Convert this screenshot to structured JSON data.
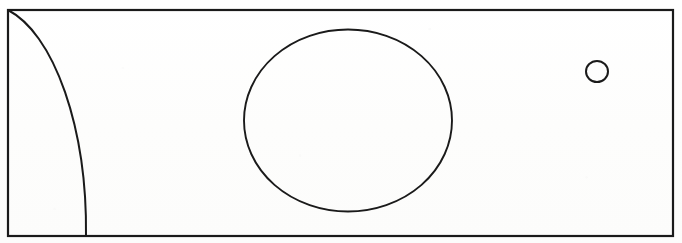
{
  "figure": {
    "kind": "line-art-diagram",
    "title": "",
    "caption": "",
    "background_color": "#ffffff",
    "ink_color": "#1a1a1a",
    "canvas": {
      "width": 682,
      "height": 243
    },
    "frame": {
      "name": "outer-rectangle",
      "x": 8,
      "y": 10,
      "width": 665,
      "height": 226,
      "stroke_width": 2.2,
      "fill": "none"
    },
    "shapes": [
      {
        "id": "corner-arc",
        "name": "quarter-arc-left",
        "type": "elliptical-arc",
        "description": "Arc anchored at the top-left corner of the frame, bulging right and meeting the bottom edge",
        "start": {
          "x": 8,
          "y": 10
        },
        "end": {
          "x": 86,
          "y": 236
        },
        "rx": 101,
        "ry": 226,
        "large_arc": 0,
        "sweep": 1,
        "stroke_width": 2.0
      },
      {
        "id": "large-circle",
        "name": "large-circle",
        "type": "ellipse",
        "cx": 348,
        "cy": 120.5,
        "rx": 104,
        "ry": 91,
        "stroke_width": 1.9,
        "fill": "none"
      },
      {
        "id": "small-circle",
        "name": "small-circle",
        "type": "ellipse",
        "cx": 597,
        "cy": 71.5,
        "rx": 11,
        "ry": 10.5,
        "stroke_width": 2.0,
        "fill": "none"
      }
    ]
  }
}
